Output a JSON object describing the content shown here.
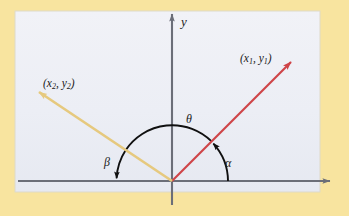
{
  "figure": {
    "name": "vector-angle-diagram",
    "page_background": "#f8e49f",
    "panel_background": "#eef0f6",
    "panel_border": "#d8d4c2",
    "axis_color": "#6b6e78",
    "arc_color": "#101010",
    "label_color": "#1a1a1a"
  },
  "axes": {
    "y_axis_label": "y",
    "x_axis_label": "",
    "origin": {
      "x": 172,
      "y": 181
    }
  },
  "vectors": [
    {
      "id": "vector-1",
      "label": "(x₁, y₁)",
      "label_text": "(x",
      "label_sub1": "1",
      "label_mid": ", y",
      "label_sub2": "1",
      "label_end": ")",
      "color": "#cf4448",
      "from": {
        "x": 172,
        "y": 181
      },
      "to": {
        "x": 294,
        "y": 59
      },
      "angle_deg": 45
    },
    {
      "id": "vector-2",
      "label": "(x₂, y₂)",
      "label_text": "(x",
      "label_sub1": "2",
      "label_mid": ", y",
      "label_sub2": "2",
      "label_end": ")",
      "color": "#e6c97e",
      "from": {
        "x": 172,
        "y": 181
      },
      "to": {
        "x": 35,
        "y": 89
      },
      "angle_deg": 146
    }
  ],
  "angles": [
    {
      "id": "angle-alpha",
      "symbol": "α",
      "description": "angle from positive x-axis to vector 1",
      "radius": 56
    },
    {
      "id": "angle-beta",
      "symbol": "β",
      "description": "angle from vector 2 to negative x-axis",
      "radius": 56
    },
    {
      "id": "angle-theta",
      "symbol": "θ",
      "description": "angle between vector 1 and vector 2",
      "radius": 56
    }
  ]
}
